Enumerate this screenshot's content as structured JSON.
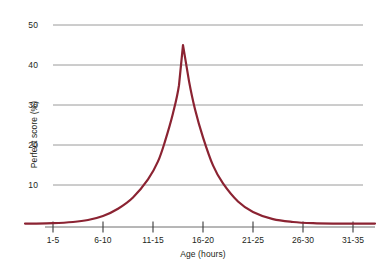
{
  "chart_data": {
    "type": "line",
    "title": "",
    "xlabel": "Age (hours)",
    "ylabel": "Perfect score (%)",
    "categories": [
      "1-5",
      "6-10",
      "11-15",
      "16-20",
      "21-25",
      "26-30",
      "31-35"
    ],
    "xtick_labels": [
      "1-5",
      "6-10",
      "11-15",
      "16-20",
      "21-25",
      "26-30",
      "31-35"
    ],
    "ytick_labels": [
      "10",
      "20",
      "30",
      "40",
      "50"
    ],
    "ytick_values": [
      10,
      20,
      30,
      40,
      50
    ],
    "ylim": [
      0,
      50
    ],
    "grid": "horizontal",
    "legend": "none",
    "line_color": "#8b2332",
    "grid_color": "#9a9a9a",
    "axis_color": "#6f6f6f",
    "text_color": "#231f20",
    "background": "#ffffff",
    "series": [
      {
        "name": "Perfect score",
        "x": [
          1,
          3,
          5,
          6.5,
          8,
          9.5,
          11,
          12.5,
          13.5,
          14.2,
          15,
          15.6,
          16,
          16.6,
          17.2,
          18,
          19,
          20,
          21.5,
          23,
          25,
          27,
          29,
          31,
          33,
          35
        ],
        "values": [
          0.5,
          0.6,
          0.9,
          1.4,
          2.4,
          4.2,
          7.0,
          11.5,
          16.0,
          21.0,
          28.0,
          35.0,
          45.0,
          36.0,
          29.0,
          22.0,
          15.0,
          10.5,
          6.0,
          3.4,
          1.6,
          0.9,
          0.6,
          0.5,
          0.5,
          0.5
        ]
      }
    ],
    "peak": {
      "x_label": "16-20",
      "value": 45
    }
  }
}
